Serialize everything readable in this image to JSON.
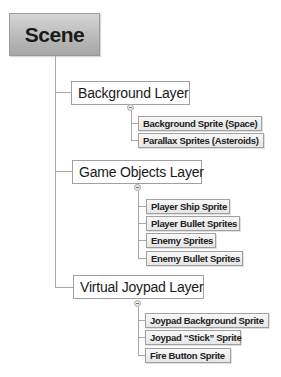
{
  "diagram": {
    "type": "hierarchy-tree",
    "root": {
      "label": "Scene"
    },
    "layers": [
      {
        "label": "Background Layer",
        "children": [
          "Background Sprite (Space)",
          "Parallax Sprites (Asteroids)"
        ]
      },
      {
        "label": "Game Objects Layer",
        "children": [
          "Player Ship Sprite",
          "Player Bullet Sprites",
          "Enemy Sprites",
          "Enemy Bullet Sprites"
        ]
      },
      {
        "label": "Virtual Joypad Layer",
        "children": [
          "Joypad Background Sprite",
          "Joypad “Stick” Sprite",
          "Fire Button Sprite"
        ]
      }
    ],
    "colors": {
      "root_fill_top": "#d6d6d6",
      "root_fill_bottom": "#a6a6a6",
      "connector": "#a8a8a8",
      "border": "#a0a0a0"
    }
  }
}
